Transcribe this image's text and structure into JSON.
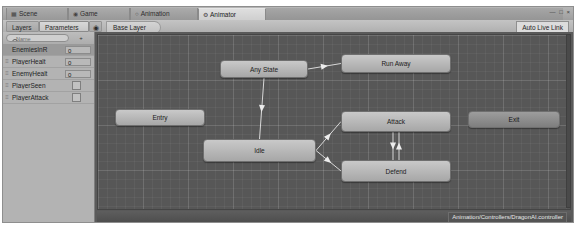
{
  "window": {
    "controls": "— □ ×"
  },
  "tabs": [
    {
      "label": "Scene",
      "icon": "scene-icon",
      "glyph": "▦",
      "active": false
    },
    {
      "label": "Game",
      "icon": "game-icon",
      "glyph": "◉",
      "active": false
    },
    {
      "label": "Animation",
      "icon": "animation-icon",
      "glyph": "○",
      "active": false
    },
    {
      "label": "Animator",
      "icon": "animator-icon",
      "glyph": "⚙",
      "active": true
    }
  ],
  "toolbar": {
    "layers_label": "Layers",
    "parameters_label": "Parameters",
    "eye_glyph": "◉",
    "breadcrumb": "Base Layer",
    "auto_live_link": "Auto Live Link"
  },
  "parameters_panel": {
    "search_placeholder": "Name",
    "search_value": "",
    "add_label": "+",
    "rows": [
      {
        "name": "EnemiesInR",
        "type": "int",
        "value": "0",
        "selected": true
      },
      {
        "name": "PlayerHealt",
        "type": "float",
        "value": "0",
        "selected": false
      },
      {
        "name": "EnemyHealt",
        "type": "float",
        "value": "0",
        "selected": false
      },
      {
        "name": "PlayerSeen",
        "type": "bool",
        "value": "",
        "selected": false
      },
      {
        "name": "PlayerAttack",
        "type": "bool",
        "value": "",
        "selected": false
      }
    ]
  },
  "graph": {
    "nodes": [
      {
        "id": "any-state",
        "label": "Any State",
        "x": 122,
        "y": 25,
        "w": 88,
        "h": 18,
        "style": "light"
      },
      {
        "id": "run-away",
        "label": "Run Away",
        "x": 243,
        "y": 19,
        "w": 110,
        "h": 19,
        "style": "light"
      },
      {
        "id": "entry",
        "label": "Entry",
        "x": 17,
        "y": 74,
        "w": 90,
        "h": 17,
        "style": "light"
      },
      {
        "id": "idle",
        "label": "Idle",
        "x": 105,
        "y": 104,
        "w": 113,
        "h": 23,
        "style": "light"
      },
      {
        "id": "attack",
        "label": "Attack",
        "x": 243,
        "y": 76,
        "w": 110,
        "h": 21,
        "style": "light"
      },
      {
        "id": "defend",
        "label": "Defend",
        "x": 243,
        "y": 125,
        "w": 110,
        "h": 22,
        "style": "light"
      },
      {
        "id": "exit",
        "label": "Exit",
        "x": 370,
        "y": 76,
        "w": 92,
        "h": 17,
        "style": "dark"
      }
    ],
    "transitions": [
      {
        "from": "any-state",
        "to": "run-away"
      },
      {
        "from": "any-state",
        "to": "idle"
      },
      {
        "from": "idle",
        "to": "attack"
      },
      {
        "from": "idle",
        "to": "defend"
      },
      {
        "from": "attack",
        "to": "defend"
      },
      {
        "from": "defend",
        "to": "attack"
      }
    ],
    "status_path": "Animation/Controllers/DragonAI.controller"
  },
  "colors": {
    "canvas_bg": "#575757",
    "node_fill": "#c9c9c9",
    "panel_bg": "#b3b3b3",
    "chrome": "#c8c8c8"
  }
}
